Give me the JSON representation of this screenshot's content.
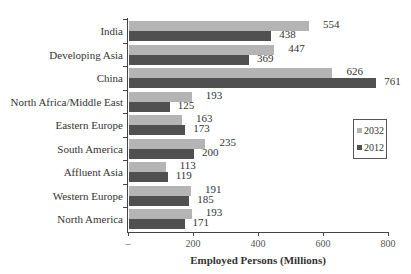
{
  "chart_data": {
    "type": "bar",
    "orientation": "horizontal",
    "title": "",
    "xlabel": "Employed Persons (Millions)",
    "ylabel": "",
    "xlim": [
      0,
      800
    ],
    "x_ticks": [
      "–",
      "200",
      "400",
      "600",
      "800"
    ],
    "grid": false,
    "legend_position": "right",
    "categories": [
      "India",
      "Developing Asia",
      "China",
      "North Africa/Middle East",
      "Eastern Europe",
      "South America",
      "Affluent Asia",
      "Western Europe",
      "North America"
    ],
    "series": [
      {
        "name": "2032",
        "color": "#b4b4b4",
        "values": [
          554,
          447,
          626,
          193,
          163,
          235,
          113,
          191,
          193
        ]
      },
      {
        "name": "2012",
        "color": "#505050",
        "values": [
          438,
          369,
          761,
          125,
          173,
          200,
          119,
          185,
          171
        ]
      }
    ]
  },
  "legend": {
    "items": [
      "2032",
      "2012"
    ]
  }
}
